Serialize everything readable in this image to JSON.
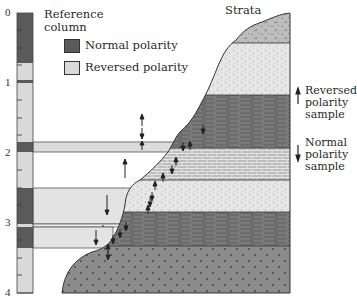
{
  "diagram": {
    "reference_column": {
      "title_line1": "Reference",
      "title_line2": "column",
      "axis_ticks": [
        "0",
        "1",
        "2",
        "3",
        "4"
      ],
      "bands": [
        {
          "from": 0.0,
          "to": 0.71,
          "polarity": "normal"
        },
        {
          "from": 0.71,
          "to": 0.96,
          "polarity": "reversed"
        },
        {
          "from": 0.96,
          "to": 1.0,
          "polarity": "normal"
        },
        {
          "from": 1.0,
          "to": 1.84,
          "polarity": "reversed"
        },
        {
          "from": 1.84,
          "to": 1.99,
          "polarity": "normal"
        },
        {
          "from": 1.99,
          "to": 2.5,
          "polarity": "reversed"
        },
        {
          "from": 2.5,
          "to": 3.01,
          "polarity": "normal"
        },
        {
          "from": 3.01,
          "to": 3.06,
          "polarity": "reversed"
        },
        {
          "from": 3.06,
          "to": 3.36,
          "polarity": "normal"
        },
        {
          "from": 3.36,
          "to": 4.0,
          "polarity": "reversed"
        }
      ]
    },
    "legend": {
      "normal_label": "Normal polarity",
      "reversed_label": "Reversed polarity",
      "normal_color": "#5a5a5a",
      "reversed_color": "#d9d9d9"
    },
    "strata": {
      "title": "Strata",
      "layers": [
        {
          "name": "speckled-cap",
          "pattern": "speckle-dark"
        },
        {
          "name": "fine-sandstone",
          "pattern": "stipple-light"
        },
        {
          "name": "shale-upper",
          "pattern": "shale"
        },
        {
          "name": "limestone",
          "pattern": "brick"
        },
        {
          "name": "sandstone",
          "pattern": "stipple-light"
        },
        {
          "name": "shale-lower",
          "pattern": "shale"
        },
        {
          "name": "basement",
          "pattern": "cross-dots"
        }
      ]
    },
    "sample_legend": {
      "reversed_line1": "Reversed",
      "reversed_line2": "polarity",
      "reversed_line3": "sample",
      "normal_line1": "Normal",
      "normal_line2": "polarity",
      "normal_line3": "sample"
    }
  }
}
